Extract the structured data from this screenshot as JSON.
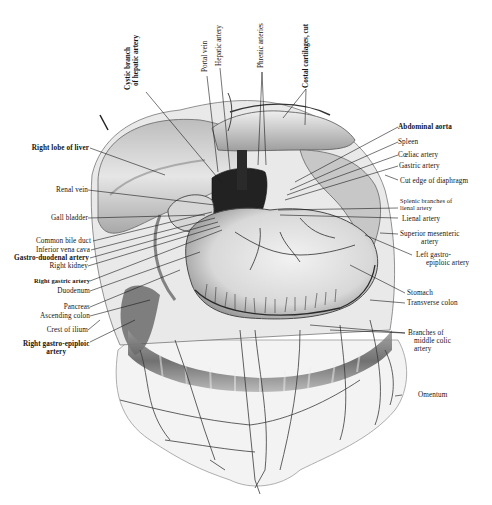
{
  "figure": {
    "labels_top": [
      {
        "id": "cystic-branch",
        "text": "Cystic branch\nof hepatic artery",
        "line1": "Cystic branch",
        "line2": "of hepatic artery"
      },
      {
        "id": "portal-vein",
        "text": "Portal vein"
      },
      {
        "id": "hepatic-artery",
        "text": "Hepatic artery"
      },
      {
        "id": "phrenic-arteries",
        "text": "Phrenic arteries"
      },
      {
        "id": "costal-cartilages",
        "text": "Costal cartilages, cut"
      }
    ],
    "labels_left": [
      {
        "id": "right-lobe-of-liver",
        "text": "Right lobe of liver"
      },
      {
        "id": "renal-vein",
        "text": "Renal vein"
      },
      {
        "id": "gall-bladder",
        "text": "Gall bladder"
      },
      {
        "id": "common-bile-duct",
        "text": "Common bile duct"
      },
      {
        "id": "inferior-vena-cava",
        "text": "Inferior vena cava"
      },
      {
        "id": "gastro-duodenal-artery",
        "text": "Gastro-duodenal artery"
      },
      {
        "id": "right-kidney",
        "text": "Right kidney"
      },
      {
        "id": "right-gastric-artery",
        "text": "Right gastric artery"
      },
      {
        "id": "duodenum",
        "text": "Duodenum"
      },
      {
        "id": "pancreas",
        "text": "Pancreas"
      },
      {
        "id": "ascending-colon",
        "text": "Ascending colon"
      },
      {
        "id": "crest-of-ilium",
        "text": "Crest of ilium"
      },
      {
        "id": "right-gastro-epiploic-artery",
        "line1": "Right gastro-epiploic",
        "line2": "artery"
      }
    ],
    "labels_right": [
      {
        "id": "abdominal-aorta",
        "text": "Abdominal aorta"
      },
      {
        "id": "spleen",
        "text": "Spleen"
      },
      {
        "id": "coeliac-artery",
        "text": "Cœliac artery"
      },
      {
        "id": "gastric-artery",
        "text": "Gastric artery"
      },
      {
        "id": "cut-edge-of-diaphragm",
        "text": "Cut edge of diaphragm"
      },
      {
        "id": "splenic-branches",
        "line1": "Splenic branches of",
        "line2": "lienal artery"
      },
      {
        "id": "lienal-artery",
        "text": "Lienal artery"
      },
      {
        "id": "superior-mesenteric-artery",
        "line1": "Superior mesenteric",
        "line2": "artery"
      },
      {
        "id": "left-gastro-epiploic-artery",
        "line1": "Left gastro-",
        "line2": "epiploic artery"
      },
      {
        "id": "stomach",
        "text": "Stomach"
      },
      {
        "id": "transverse-colon",
        "text": "Transverse colon"
      },
      {
        "id": "branches-of-middle-colic",
        "line1": "Branches of",
        "line2": "middle colic",
        "line3": "artery"
      },
      {
        "id": "omentum",
        "text": "Omentum"
      }
    ],
    "colors": {
      "ink": "#141414",
      "shade_dark": "#3a3a3a",
      "shade_mid": "#8a8a8a",
      "shade_light": "#cfcfcf",
      "paper": "#ffffff"
    }
  }
}
